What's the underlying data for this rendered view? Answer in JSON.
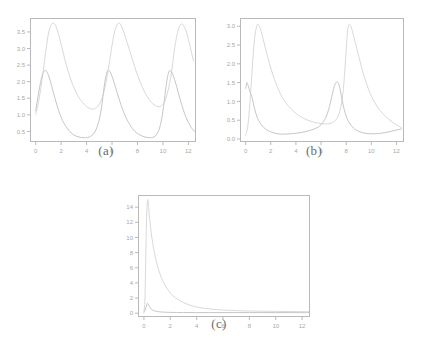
{
  "figure": {
    "background": "#ffffff",
    "axis_color": "#b9b9b9",
    "tick_label_color": "#a8a8a8",
    "caption_color": "#6b6b6b"
  },
  "chart_data": [
    {
      "id": "panel-a",
      "type": "line",
      "title": "",
      "caption": "(a)",
      "xlabel": "",
      "ylabel": "",
      "xlim": [
        -0.45,
        12.6
      ],
      "ylim": [
        0.18,
        3.92
      ],
      "xticks": [
        0,
        2,
        4,
        6,
        8,
        10,
        12
      ],
      "xtick_labels": [
        "0",
        "2",
        "4",
        "6",
        "8",
        "10",
        "12"
      ],
      "yticks": [
        0.5,
        1.0,
        1.5,
        2.0,
        2.5,
        3.0,
        3.5
      ],
      "ytick_labels": [
        "0.5",
        "1.0",
        "1.5",
        "2.0",
        "2.5",
        "3.0",
        "3.5"
      ],
      "grid": false,
      "legend": "none",
      "series": [
        {
          "name": "series-1",
          "color": "#d9d9d9",
          "linewidth": 1.0,
          "comment": "tall periodic peaks, amplitude ~3.75, period ~4.75",
          "x": [
            0.0,
            0.2,
            0.4,
            0.6,
            0.8,
            1.0,
            1.2,
            1.4,
            1.6,
            1.8,
            2.0,
            2.3,
            2.6,
            3.0,
            3.4,
            3.8,
            4.2,
            4.6,
            5.0,
            5.4,
            5.8,
            6.0,
            6.2,
            6.4,
            6.6,
            6.8,
            7.0,
            7.4,
            7.8,
            8.2,
            8.6,
            9.0,
            9.4,
            9.8,
            10.2,
            10.6,
            10.9,
            11.1,
            11.3,
            11.5,
            11.8,
            12.1,
            12.4
          ],
          "y": [
            1.02,
            1.35,
            1.8,
            2.35,
            2.95,
            3.45,
            3.7,
            3.76,
            3.66,
            3.42,
            3.12,
            2.66,
            2.25,
            1.82,
            1.52,
            1.32,
            1.2,
            1.18,
            1.32,
            1.75,
            2.6,
            3.1,
            3.5,
            3.72,
            3.76,
            3.62,
            3.4,
            2.92,
            2.42,
            2.0,
            1.66,
            1.42,
            1.28,
            1.26,
            1.46,
            2.1,
            2.95,
            3.4,
            3.66,
            3.74,
            3.56,
            3.12,
            2.62
          ]
        },
        {
          "name": "series-2",
          "color": "#c6c6c6",
          "linewidth": 1.0,
          "comment": "lower sharper peaks, amplitude ~2.35, period ~4.75",
          "x": [
            0.0,
            0.15,
            0.3,
            0.45,
            0.6,
            0.75,
            0.9,
            1.1,
            1.3,
            1.6,
            1.9,
            2.2,
            2.6,
            3.0,
            3.4,
            3.8,
            4.2,
            4.6,
            4.9,
            5.1,
            5.25,
            5.4,
            5.55,
            5.7,
            5.9,
            6.2,
            6.6,
            7.0,
            7.4,
            7.8,
            8.2,
            8.6,
            9.0,
            9.4,
            9.7,
            9.9,
            10.05,
            10.2,
            10.35,
            10.5,
            10.7,
            11.0,
            11.4,
            11.8,
            12.2,
            12.5
          ],
          "y": [
            1.12,
            1.48,
            1.82,
            2.1,
            2.28,
            2.34,
            2.28,
            2.08,
            1.8,
            1.38,
            1.02,
            0.76,
            0.53,
            0.39,
            0.33,
            0.31,
            0.33,
            0.45,
            0.72,
            1.05,
            1.45,
            1.9,
            2.22,
            2.34,
            2.26,
            1.92,
            1.42,
            1.0,
            0.7,
            0.5,
            0.39,
            0.33,
            0.31,
            0.36,
            0.56,
            0.88,
            1.25,
            1.72,
            2.12,
            2.32,
            2.28,
            1.96,
            1.4,
            0.94,
            0.63,
            0.5
          ]
        }
      ]
    },
    {
      "id": "panel-b",
      "type": "line",
      "title": "",
      "caption": "(b)",
      "xlabel": "",
      "ylabel": "",
      "xlim": [
        -0.45,
        12.6
      ],
      "ylim": [
        -0.08,
        3.22
      ],
      "xticks": [
        0,
        2,
        4,
        6,
        8,
        10,
        12
      ],
      "xtick_labels": [
        "0",
        "2",
        "4",
        "6",
        "8",
        "10",
        "12"
      ],
      "yticks": [
        0.0,
        0.5,
        1.0,
        1.5,
        2.0,
        2.5,
        3.0
      ],
      "ytick_labels": [
        "0.0",
        "0.5",
        "1.0",
        "1.5",
        "2.0",
        "2.5",
        "3.0"
      ],
      "grid": false,
      "legend": "none",
      "series": [
        {
          "name": "series-1",
          "color": "#d9d9d9",
          "linewidth": 1.0,
          "comment": "tall sharp peaks ~3.05 at x=0.95 and x=8.1, long decay",
          "x": [
            0.0,
            0.15,
            0.3,
            0.45,
            0.6,
            0.75,
            0.9,
            1.0,
            1.15,
            1.35,
            1.6,
            1.9,
            2.3,
            2.8,
            3.3,
            3.8,
            4.3,
            4.8,
            5.3,
            5.8,
            6.3,
            6.8,
            7.2,
            7.5,
            7.75,
            7.95,
            8.1,
            8.25,
            8.45,
            8.7,
            9.0,
            9.4,
            9.9,
            10.4,
            10.9,
            11.4,
            11.9,
            12.4
          ],
          "y": [
            0.1,
            0.3,
            0.78,
            1.5,
            2.25,
            2.78,
            3.02,
            3.05,
            2.96,
            2.72,
            2.38,
            2.0,
            1.58,
            1.18,
            0.92,
            0.74,
            0.61,
            0.52,
            0.46,
            0.42,
            0.4,
            0.42,
            0.52,
            0.75,
            1.25,
            2.1,
            2.85,
            3.05,
            2.92,
            2.6,
            2.2,
            1.7,
            1.22,
            0.9,
            0.68,
            0.52,
            0.4,
            0.3
          ]
        },
        {
          "name": "series-2",
          "color": "#c6c6c6",
          "linewidth": 1.0,
          "comment": "low plateau with peaks ~1.5 near x=0.15 and x=7.2",
          "x": [
            0.0,
            0.1,
            0.2,
            0.35,
            0.5,
            0.7,
            0.95,
            1.25,
            1.6,
            2.0,
            2.5,
            3.0,
            3.6,
            4.2,
            4.8,
            5.4,
            5.9,
            6.3,
            6.6,
            6.85,
            7.0,
            7.15,
            7.3,
            7.45,
            7.6,
            7.8,
            8.1,
            8.5,
            8.9,
            9.4,
            9.9,
            10.4,
            10.9,
            11.4,
            11.9,
            12.4
          ],
          "y": [
            1.35,
            1.5,
            1.42,
            1.25,
            1.12,
            0.82,
            0.55,
            0.38,
            0.26,
            0.19,
            0.14,
            0.13,
            0.14,
            0.16,
            0.2,
            0.26,
            0.35,
            0.52,
            0.78,
            1.12,
            1.34,
            1.48,
            1.52,
            1.42,
            1.18,
            0.84,
            0.52,
            0.32,
            0.22,
            0.16,
            0.14,
            0.14,
            0.16,
            0.19,
            0.23,
            0.27
          ]
        }
      ]
    },
    {
      "id": "panel-c",
      "type": "line",
      "title": "",
      "caption": "(c)",
      "xlabel": "",
      "ylabel": "",
      "xlim": [
        -0.45,
        12.6
      ],
      "ylim": [
        -0.5,
        15.6
      ],
      "xticks": [
        0,
        2,
        4,
        6,
        8,
        10,
        12
      ],
      "xtick_labels": [
        "0",
        "2",
        "4",
        "6",
        "8",
        "10",
        "12"
      ],
      "yticks": [
        0,
        2,
        4,
        6,
        8,
        10,
        12,
        14
      ],
      "ytick_labels": [
        "0",
        "2",
        "4",
        "6",
        "8",
        "10",
        "12",
        "14"
      ],
      "grid": false,
      "legend": "none",
      "series": [
        {
          "name": "series-1",
          "color": "#d9d9d9",
          "linewidth": 1.0,
          "comment": "single tall spike ~15 at x=0.32, long slow decay to ~0.2",
          "x": [
            0.0,
            0.08,
            0.15,
            0.2,
            0.25,
            0.3,
            0.35,
            0.4,
            0.5,
            0.6,
            0.75,
            0.9,
            1.1,
            1.3,
            1.6,
            1.9,
            2.2,
            2.6,
            3.0,
            3.5,
            4.0,
            4.5,
            5.0,
            5.6,
            6.2,
            7.0,
            8.0,
            9.0,
            10.0,
            11.0,
            12.0,
            12.5
          ],
          "y": [
            0.2,
            2.0,
            8.5,
            12.4,
            14.4,
            15.0,
            14.2,
            13.1,
            11.4,
            10.0,
            8.4,
            7.1,
            5.8,
            4.8,
            3.7,
            2.9,
            2.3,
            1.8,
            1.4,
            1.05,
            0.82,
            0.66,
            0.56,
            0.46,
            0.4,
            0.34,
            0.29,
            0.26,
            0.24,
            0.22,
            0.21,
            0.2
          ]
        },
        {
          "name": "series-2",
          "color": "#c6c6c6",
          "linewidth": 1.0,
          "comment": "narrow low spike ~1.3 near x=0.28, flat near zero afterwards",
          "x": [
            0.0,
            0.1,
            0.18,
            0.24,
            0.28,
            0.33,
            0.4,
            0.5,
            0.65,
            0.85,
            1.1,
            1.5,
            2.0,
            3.0,
            4.0,
            5.0,
            6.0,
            7.0,
            8.0,
            9.0,
            10.0,
            11.0,
            12.0,
            12.5
          ],
          "y": [
            0.1,
            0.45,
            0.95,
            1.22,
            1.3,
            1.18,
            0.92,
            0.64,
            0.42,
            0.28,
            0.2,
            0.14,
            0.11,
            0.09,
            0.08,
            0.08,
            0.08,
            0.08,
            0.08,
            0.08,
            0.08,
            0.08,
            0.08,
            0.08
          ]
        }
      ]
    }
  ]
}
